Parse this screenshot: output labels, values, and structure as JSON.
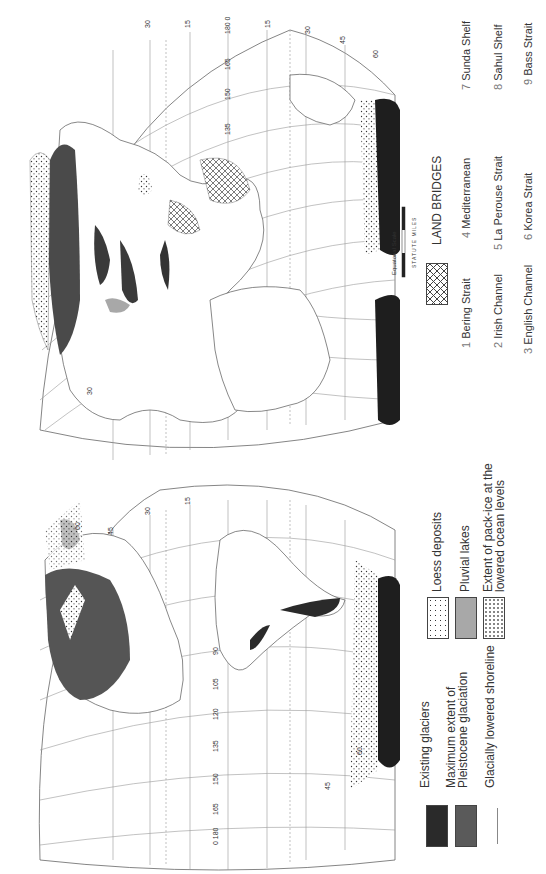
{
  "figure": {
    "orientation": "rotated 90 degrees"
  },
  "legend": {
    "items": [
      {
        "label": "Existing glaciers",
        "swatch": "solid",
        "color": "#2a2a2a"
      },
      {
        "label": "Maximum extent of Pleistocene glaciation",
        "line1": "Maximum  extent  of",
        "line2": "Pleistocene  glaciation",
        "swatch": "solid",
        "color": "#5a5a5a"
      },
      {
        "label": "Glacially lowered shoreline",
        "swatch": "line",
        "color": "#888888"
      },
      {
        "label": "Loess deposits",
        "swatch": "dots",
        "color": "#ffffff"
      },
      {
        "label": "Pluvial lakes",
        "swatch": "solid",
        "color": "#a8a8a8"
      },
      {
        "label": "Extent of pack-ice at the lowered ocean levels",
        "line1": "Extent  of  pack-ice  at  the",
        "line2": "lowered  ocean  levels",
        "swatch": "dots-sparse",
        "color": "#ffffff"
      }
    ],
    "land_bridges": {
      "title": "LAND   BRIDGES",
      "swatch": "crosshatch",
      "items": [
        {
          "num": "1",
          "name": "Bering   Strait"
        },
        {
          "num": "2",
          "name": "Irish   Channel"
        },
        {
          "num": "3",
          "name": "English   Channel"
        },
        {
          "num": "4",
          "name": "Mediterranean"
        },
        {
          "num": "5",
          "name": "La   Perouse   Strait"
        },
        {
          "num": "6",
          "name": "Korea   Strait"
        },
        {
          "num": "7",
          "name": "Sunda Shelf"
        },
        {
          "num": "8",
          "name": "Sahul Shelf"
        },
        {
          "num": "9",
          "name": "Bass  Strait"
        }
      ]
    }
  },
  "scale": {
    "title": "Equatorial   Scale",
    "units": "STATUTE   MILES",
    "ticks": [
      "0",
      "1000",
      "2000",
      "3000"
    ]
  },
  "grid_labels": {
    "eastern_longitudes": [
      "0",
      "15",
      "30",
      "45",
      "60",
      "75",
      "90",
      "105",
      "120",
      "135",
      "150",
      "165",
      "180"
    ],
    "latitudes": [
      "0",
      "15",
      "30",
      "45",
      "60",
      "75",
      "90"
    ],
    "polar_longitudes": [
      "0",
      "30",
      "60",
      "90",
      "120",
      "150",
      "180"
    ]
  },
  "map_annotations": [
    "6",
    "8",
    "9",
    "2"
  ]
}
